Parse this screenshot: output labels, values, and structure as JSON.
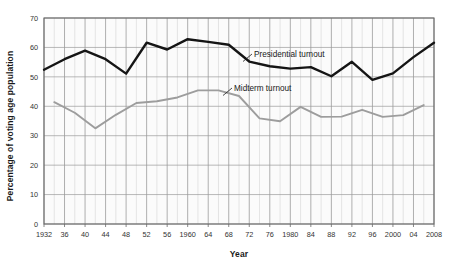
{
  "chart_data": {
    "type": "line",
    "title": "",
    "xlabel": "Year",
    "ylabel": "Percentage of voting age population",
    "ylim": [
      0,
      70
    ],
    "ytick_labels": [
      "0",
      "10",
      "20",
      "30",
      "40",
      "50",
      "60",
      "70"
    ],
    "ytick_values": [
      0,
      10,
      20,
      30,
      40,
      50,
      60,
      70
    ],
    "grid": true,
    "grid_major_horizontal": true,
    "grid_minor_vertical": true,
    "legend_position": "inline-annotations",
    "x": [
      1932,
      1936,
      1940,
      1944,
      1948,
      1952,
      1956,
      1960,
      1964,
      1968,
      1972,
      1976,
      1980,
      1984,
      1988,
      1992,
      1996,
      2000,
      2004,
      2008
    ],
    "categories": [
      "1932",
      "36",
      "40",
      "44",
      "48",
      "52",
      "56",
      "1960",
      "64",
      "68",
      "72",
      "76",
      "1980",
      "84",
      "88",
      "92",
      "96",
      "2000",
      "04",
      "2008"
    ],
    "series": [
      {
        "name": "Presidential turnout",
        "color": "#151515",
        "x": [
          1932,
          1936,
          1940,
          1944,
          1948,
          1952,
          1956,
          1960,
          1964,
          1968,
          1972,
          1976,
          1980,
          1984,
          1988,
          1992,
          1996,
          2000,
          2004,
          2008
        ],
        "values": [
          52.4,
          56.0,
          58.9,
          56.0,
          51.1,
          61.6,
          59.3,
          62.8,
          61.9,
          60.9,
          55.2,
          53.6,
          52.8,
          53.3,
          50.2,
          55.1,
          49.0,
          51.2,
          56.7,
          61.6
        ]
      },
      {
        "name": "Midterm turnout",
        "color": "#9d9d9d",
        "x": [
          1934,
          1938,
          1942,
          1946,
          1950,
          1954,
          1958,
          1962,
          1966,
          1970,
          1974,
          1978,
          1982,
          1986,
          1990,
          1994,
          1998,
          2002,
          2006
        ],
        "values": [
          41.4,
          37.8,
          32.5,
          37.1,
          41.1,
          41.7,
          43.0,
          45.4,
          45.4,
          43.5,
          35.9,
          34.9,
          39.8,
          36.4,
          36.5,
          38.8,
          36.4,
          37.0,
          40.4
        ]
      }
    ],
    "annotations": [
      {
        "text": "Presidential turnout",
        "series": "Presidential turnout"
      },
      {
        "text": "Midterm turnout",
        "series": "Midterm turnout"
      }
    ]
  }
}
